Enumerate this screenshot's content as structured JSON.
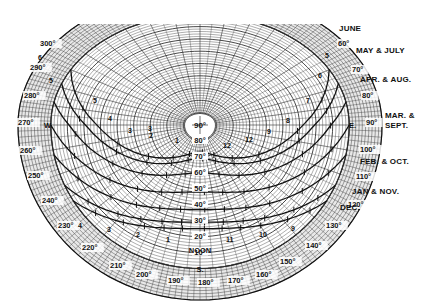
{
  "diagram": {
    "type": "sun-path-chart",
    "center_label": "90°",
    "altitude_labels": [
      "80°",
      "70°",
      "60°",
      "50°",
      "40°",
      "30°",
      "20°",
      "10°"
    ],
    "noon_label": "NOON",
    "south_label": "S.",
    "east_label": "E.",
    "west_label": "W.",
    "azimuth_labels": [
      {
        "text": "300°",
        "x": 40,
        "y": 46
      },
      {
        "text": "290°",
        "x": 30,
        "y": 70
      },
      {
        "text": "280°",
        "x": 24,
        "y": 98
      },
      {
        "text": "270°",
        "x": 18,
        "y": 125
      },
      {
        "text": "260°",
        "x": 20,
        "y": 153
      },
      {
        "text": "250°",
        "x": 28,
        "y": 178
      },
      {
        "text": "240°",
        "x": 42,
        "y": 203
      },
      {
        "text": "230°",
        "x": 58,
        "y": 228
      },
      {
        "text": "220°",
        "x": 82,
        "y": 250
      },
      {
        "text": "210°",
        "x": 110,
        "y": 268
      },
      {
        "text": "200°",
        "x": 136,
        "y": 277
      },
      {
        "text": "190°",
        "x": 168,
        "y": 283
      },
      {
        "text": "180°",
        "x": 198,
        "y": 285
      },
      {
        "text": "170°",
        "x": 228,
        "y": 283
      },
      {
        "text": "160°",
        "x": 256,
        "y": 277
      },
      {
        "text": "150°",
        "x": 280,
        "y": 264
      },
      {
        "text": "140°",
        "x": 306,
        "y": 248
      },
      {
        "text": "130°",
        "x": 326,
        "y": 228
      },
      {
        "text": "120°",
        "x": 348,
        "y": 207
      },
      {
        "text": "110°",
        "x": 356,
        "y": 179
      },
      {
        "text": "100°",
        "x": 360,
        "y": 152
      },
      {
        "text": "90°",
        "x": 366,
        "y": 125
      },
      {
        "text": "80°",
        "x": 362,
        "y": 98
      },
      {
        "text": "70°",
        "x": 352,
        "y": 72
      },
      {
        "text": "60°",
        "x": 338,
        "y": 46
      }
    ],
    "month_labels": [
      {
        "text": "JUNE",
        "x": 339,
        "y": 31
      },
      {
        "text": "MAY & JULY",
        "x": 356,
        "y": 53
      },
      {
        "text": "APR. & AUG.",
        "x": 360,
        "y": 82
      },
      {
        "text": "MAR. &",
        "x": 385,
        "y": 118
      },
      {
        "text": "SEPT.",
        "x": 385,
        "y": 128
      },
      {
        "text": "FEB. & OCT.",
        "x": 360,
        "y": 164
      },
      {
        "text": "JAN & NOV.",
        "x": 352,
        "y": 194
      },
      {
        "text": "DEC.",
        "x": 340,
        "y": 210
      }
    ],
    "curves": [
      {
        "name": "june",
        "alt_max": 73
      },
      {
        "name": "may-july",
        "alt_max": 69
      },
      {
        "name": "apr-aug",
        "alt_max": 60
      },
      {
        "name": "mar-sept",
        "alt_max": 48
      },
      {
        "name": "feb-oct",
        "alt_max": 37
      },
      {
        "name": "jan-nov",
        "alt_max": 29
      },
      {
        "name": "dec",
        "alt_max": 25
      }
    ],
    "hour_labels": [
      {
        "text": "6",
        "x": 38,
        "y": 60
      },
      {
        "text": "5",
        "x": 49,
        "y": 83
      },
      {
        "text": "5",
        "x": 93,
        "y": 103
      },
      {
        "text": "4",
        "x": 108,
        "y": 121
      },
      {
        "text": "3",
        "x": 128,
        "y": 133
      },
      {
        "text": "3",
        "x": 148,
        "y": 131
      },
      {
        "text": "2",
        "x": 149,
        "y": 138
      },
      {
        "text": "1",
        "x": 175,
        "y": 143
      },
      {
        "text": "12",
        "x": 223,
        "y": 148
      },
      {
        "text": "12",
        "x": 245,
        "y": 142
      },
      {
        "text": "9",
        "x": 267,
        "y": 134
      },
      {
        "text": "8",
        "x": 286,
        "y": 123
      },
      {
        "text": "7",
        "x": 306,
        "y": 103
      },
      {
        "text": "6",
        "x": 318,
        "y": 78
      },
      {
        "text": "5",
        "x": 325,
        "y": 58
      },
      {
        "text": "4",
        "x": 78,
        "y": 228
      },
      {
        "text": "3",
        "x": 107,
        "y": 232
      },
      {
        "text": "2",
        "x": 136,
        "y": 237
      },
      {
        "text": "1",
        "x": 166,
        "y": 242
      },
      {
        "text": "11",
        "x": 226,
        "y": 242
      },
      {
        "text": "10",
        "x": 259,
        "y": 237
      },
      {
        "text": "9",
        "x": 291,
        "y": 231
      }
    ]
  },
  "colors": {
    "ink": "#111111",
    "grid": "#333333",
    "background": "#ffffff"
  }
}
